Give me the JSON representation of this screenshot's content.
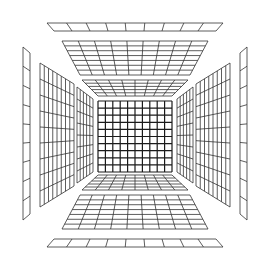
{
  "canvas": {
    "width": 270,
    "height": 267,
    "background": "#ffffff"
  },
  "colors": {
    "line": "#333333",
    "center_line": "#1a1a1a"
  },
  "panels": [
    {
      "name": "center-back-wall-grid",
      "kind": "center",
      "quad": [
        [
          98,
          101
        ],
        [
          172,
          101
        ],
        [
          172,
          172
        ],
        [
          98,
          172
        ]
      ],
      "cols": 10,
      "rows": 10
    },
    {
      "name": "ceiling-inner-grid",
      "kind": "h",
      "quad": [
        [
          82,
          80
        ],
        [
          188,
          80
        ],
        [
          172,
          96
        ],
        [
          98,
          96
        ]
      ],
      "cols": 8,
      "rows": 5
    },
    {
      "name": "ceiling-middle-grid",
      "kind": "h",
      "quad": [
        [
          62,
          41
        ],
        [
          208,
          41
        ],
        [
          190,
          75
        ],
        [
          80,
          75
        ]
      ],
      "cols": 9,
      "rows": 7
    },
    {
      "name": "ceiling-outer-grid",
      "kind": "h",
      "quad": [
        [
          47,
          23
        ],
        [
          223,
          23
        ],
        [
          216,
          31
        ],
        [
          54,
          31
        ]
      ],
      "cols": 9,
      "rows": 1
    },
    {
      "name": "floor-inner-grid",
      "kind": "h",
      "quad": [
        [
          98,
          175
        ],
        [
          172,
          175
        ],
        [
          188,
          190
        ],
        [
          82,
          190
        ]
      ],
      "cols": 8,
      "rows": 5
    },
    {
      "name": "floor-middle-grid",
      "kind": "h",
      "quad": [
        [
          80,
          195
        ],
        [
          190,
          195
        ],
        [
          208,
          229
        ],
        [
          62,
          229
        ]
      ],
      "cols": 9,
      "rows": 7
    },
    {
      "name": "floor-outer-grid",
      "kind": "h",
      "quad": [
        [
          54,
          239
        ],
        [
          216,
          239
        ],
        [
          223,
          247
        ],
        [
          47,
          247
        ]
      ],
      "cols": 9,
      "rows": 1
    },
    {
      "name": "left-wall-inner-grid",
      "kind": "v",
      "quad": [
        [
          77,
          87
        ],
        [
          93,
          99
        ],
        [
          93,
          172
        ],
        [
          77,
          183
        ]
      ],
      "cols": 5,
      "rows": 8
    },
    {
      "name": "left-wall-middle-grid",
      "kind": "v",
      "quad": [
        [
          40,
          63
        ],
        [
          74,
          84
        ],
        [
          74,
          186
        ],
        [
          40,
          207
        ]
      ],
      "cols": 8,
      "rows": 9
    },
    {
      "name": "left-wall-outer-grid",
      "kind": "v",
      "quad": [
        [
          23,
          47
        ],
        [
          30,
          53
        ],
        [
          30,
          214
        ],
        [
          23,
          220
        ]
      ],
      "cols": 1,
      "rows": 9
    },
    {
      "name": "right-wall-inner-grid",
      "kind": "v",
      "quad": [
        [
          177,
          99
        ],
        [
          193,
          87
        ],
        [
          193,
          183
        ],
        [
          177,
          172
        ]
      ],
      "cols": 5,
      "rows": 8
    },
    {
      "name": "right-wall-middle-grid",
      "kind": "v",
      "quad": [
        [
          196,
          84
        ],
        [
          230,
          63
        ],
        [
          230,
          207
        ],
        [
          196,
          186
        ]
      ],
      "cols": 8,
      "rows": 9
    },
    {
      "name": "right-wall-outer-grid",
      "kind": "v",
      "quad": [
        [
          240,
          53
        ],
        [
          247,
          47
        ],
        [
          247,
          220
        ],
        [
          240,
          214
        ]
      ],
      "cols": 1,
      "rows": 9
    }
  ]
}
